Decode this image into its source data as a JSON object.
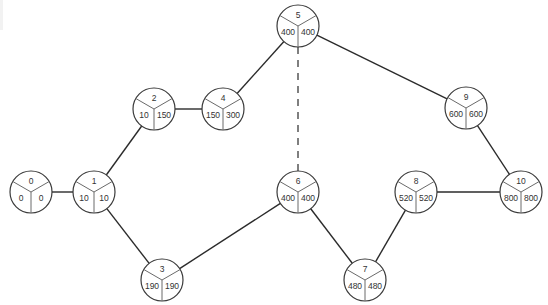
{
  "diagram": {
    "type": "activity-network",
    "node_radius": 21,
    "colors": {
      "edge": "#2b2b2b",
      "node_stroke": "#3a3a3a",
      "spoke": "#6a6a6a",
      "text": "#333333",
      "background": "#ffffff"
    },
    "nodes": [
      {
        "id": "0",
        "label": "0",
        "earliest": "0",
        "latest": "0",
        "x": 31,
        "y": 192
      },
      {
        "id": "1",
        "label": "1",
        "earliest": "10",
        "latest": "10",
        "x": 94,
        "y": 192
      },
      {
        "id": "2",
        "label": "2",
        "earliest": "10",
        "latest": "150",
        "x": 154,
        "y": 109
      },
      {
        "id": "3",
        "label": "3",
        "earliest": "190",
        "latest": "190",
        "x": 162,
        "y": 280
      },
      {
        "id": "4",
        "label": "4",
        "earliest": "150",
        "latest": "300",
        "x": 223,
        "y": 109
      },
      {
        "id": "5",
        "label": "5",
        "earliest": "400",
        "latest": "400",
        "x": 298,
        "y": 26
      },
      {
        "id": "6",
        "label": "6",
        "earliest": "400",
        "latest": "400",
        "x": 298,
        "y": 192
      },
      {
        "id": "7",
        "label": "7",
        "earliest": "480",
        "latest": "480",
        "x": 365,
        "y": 280
      },
      {
        "id": "8",
        "label": "8",
        "earliest": "520",
        "latest": "520",
        "x": 416,
        "y": 192
      },
      {
        "id": "9",
        "label": "9",
        "earliest": "600",
        "latest": "600",
        "x": 466,
        "y": 108
      },
      {
        "id": "10",
        "label": "10",
        "earliest": "800",
        "latest": "800",
        "x": 521,
        "y": 192
      }
    ],
    "edges": [
      {
        "from": "0",
        "to": "1",
        "style": "solid"
      },
      {
        "from": "1",
        "to": "2",
        "style": "solid"
      },
      {
        "from": "1",
        "to": "3",
        "style": "solid"
      },
      {
        "from": "2",
        "to": "4",
        "style": "solid"
      },
      {
        "from": "4",
        "to": "5",
        "style": "solid"
      },
      {
        "from": "3",
        "to": "6",
        "style": "solid"
      },
      {
        "from": "5",
        "to": "6",
        "style": "dashed"
      },
      {
        "from": "5",
        "to": "9",
        "style": "solid"
      },
      {
        "from": "6",
        "to": "7",
        "style": "solid"
      },
      {
        "from": "7",
        "to": "8",
        "style": "solid"
      },
      {
        "from": "8",
        "to": "10",
        "style": "solid"
      },
      {
        "from": "9",
        "to": "10",
        "style": "solid"
      }
    ]
  }
}
